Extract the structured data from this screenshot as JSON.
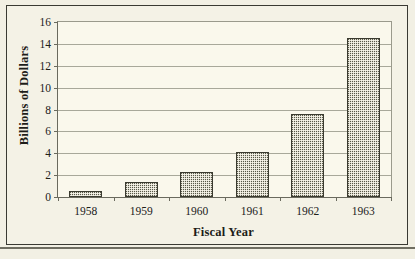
{
  "chart_data": {
    "type": "bar",
    "title": "",
    "xlabel": "Fiscal Year",
    "ylabel": "Billions of Dollars",
    "categories": [
      "1958",
      "1959",
      "1960",
      "1961",
      "1962",
      "1963"
    ],
    "values": [
      0.5,
      1.35,
      2.2,
      4.1,
      7.5,
      14.5
    ],
    "ylim": [
      0,
      16
    ],
    "yticks": [
      0,
      2,
      4,
      6,
      8,
      10,
      12,
      14,
      16
    ],
    "ytick_labels": [
      "0",
      "2",
      "4",
      "6",
      "8",
      "10",
      "12",
      "14",
      "16"
    ],
    "grid": true,
    "legend": null,
    "bar_color": "#585848",
    "plot_background": "#faf8ec",
    "figure_background": "#f2f0e4",
    "axis_color": "#6a6a5e",
    "gridline_color": "#a8a89a"
  }
}
